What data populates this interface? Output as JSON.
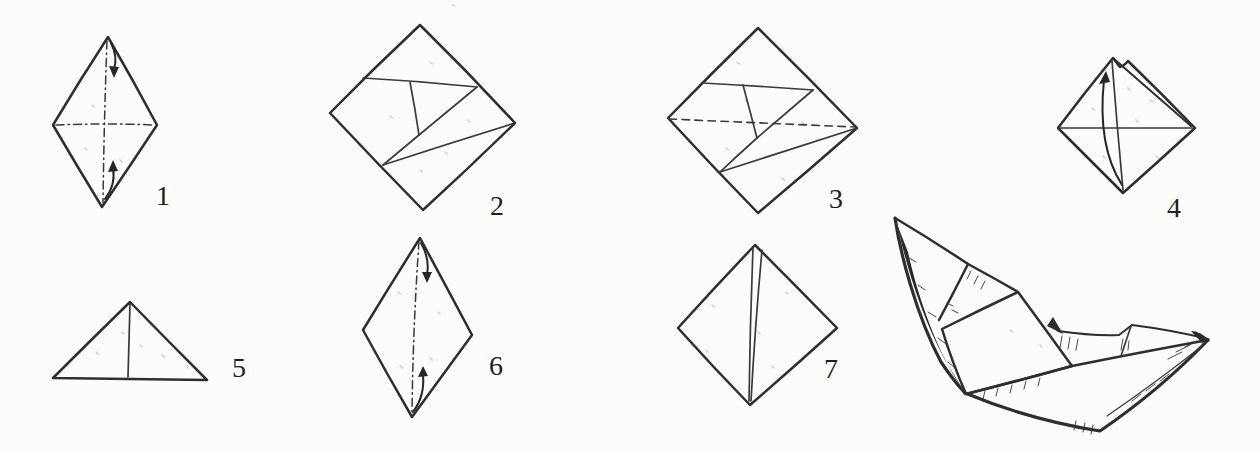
{
  "figure": {
    "kind": "origami-folding-sequence-diagram",
    "final_model": "paper-boat",
    "colors": {
      "paper": "#fcfcfa",
      "ink": "#2e2e2e"
    },
    "steps": [
      {
        "label": "1"
      },
      {
        "label": "2"
      },
      {
        "label": "3"
      },
      {
        "label": "4"
      },
      {
        "label": "5"
      },
      {
        "label": "6"
      },
      {
        "label": "7"
      }
    ]
  }
}
